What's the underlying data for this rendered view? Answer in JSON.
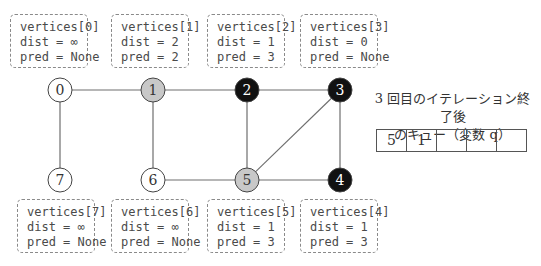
{
  "vertices_top": [
    {
      "title": "vertices[0]",
      "dist": "dist = ∞",
      "pred": "pred = None"
    },
    {
      "title": "vertices[1]",
      "dist": "dist = 2",
      "pred": "pred = 2"
    },
    {
      "title": "vertices[2]",
      "dist": "dist = 1",
      "pred": "pred = 3"
    },
    {
      "title": "vertices[3]",
      "dist": "dist = 0",
      "pred": "pred = None"
    }
  ],
  "vertices_bottom": [
    {
      "title": "vertices[7]",
      "dist": "dist = ∞",
      "pred": "pred = None"
    },
    {
      "title": "vertices[6]",
      "dist": "dist = ∞",
      "pred": "pred = None"
    },
    {
      "title": "vertices[5]",
      "dist": "dist = 1",
      "pred": "pred = 3"
    },
    {
      "title": "vertices[4]",
      "dist": "dist = 1",
      "pred": "pred = 3"
    }
  ],
  "graph": {
    "nodes": [
      {
        "id": "0",
        "x": 60,
        "y": 90,
        "state": "white"
      },
      {
        "id": "1",
        "x": 153,
        "y": 90,
        "state": "gray"
      },
      {
        "id": "2",
        "x": 247,
        "y": 90,
        "state": "black"
      },
      {
        "id": "3",
        "x": 340,
        "y": 90,
        "state": "black"
      },
      {
        "id": "4",
        "x": 340,
        "y": 180,
        "state": "black"
      },
      {
        "id": "5",
        "x": 247,
        "y": 180,
        "state": "gray"
      },
      {
        "id": "6",
        "x": 153,
        "y": 180,
        "state": "white"
      },
      {
        "id": "7",
        "x": 60,
        "y": 180,
        "state": "white"
      }
    ],
    "edges": [
      [
        "0",
        "1"
      ],
      [
        "1",
        "2"
      ],
      [
        "2",
        "3"
      ],
      [
        "0",
        "7"
      ],
      [
        "1",
        "6"
      ],
      [
        "2",
        "5"
      ],
      [
        "3",
        "5"
      ],
      [
        "3",
        "4"
      ],
      [
        "6",
        "5"
      ],
      [
        "5",
        "4"
      ]
    ],
    "colors": {
      "white": "#ffffff",
      "gray": "#c8c8c8",
      "black": "#111111",
      "edge": "#6e6e6e"
    }
  },
  "queue": {
    "title_line1": "3 回目のイテレーション終了後",
    "title_line2": "のキュー（変数 q）",
    "cells": [
      "5",
      "1",
      "",
      "",
      ""
    ]
  }
}
